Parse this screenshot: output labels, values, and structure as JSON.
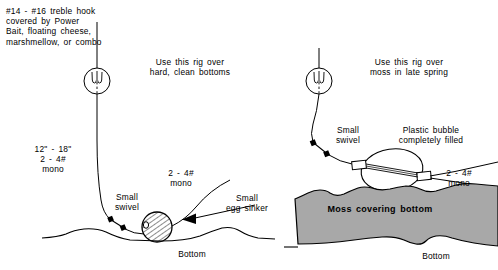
{
  "diagram": {
    "title_hidden": "",
    "colors": {
      "ink": "#000000",
      "moss_fill": "#a8a8a8",
      "background": "#ffffff"
    },
    "labels": {
      "bait_note": "#14 - #16 treble hook\ncovered by Power\nBait, floating cheese,\nmarshmellow, or combo",
      "left_usage": "Use this rig over\nhard, clean bottoms",
      "right_usage": "Use this rig over\nmoss in late spring",
      "leader_left": "12\" - 18\"\n2 - 4#\nmono",
      "mono_left": "2 - 4#\nmono",
      "mono_right": "2 - 4#\nmono",
      "swivel_left": "Small\nswivel",
      "swivel_right": "Small\nswivel",
      "egg_sinker": "Small\negg sinker",
      "plastic_bubble": "Plastic bubble\ncompletely filled",
      "moss_bottom": "Moss covering bottom",
      "bottom_left": "Bottom",
      "bottom_right": "Bottom"
    },
    "icons": {
      "bait_ball_left": "treble-hook-bait-ball-icon",
      "bait_ball_right": "treble-hook-bait-ball-icon",
      "swivel_left": "swivel-icon",
      "swivel_right": "swivel-icon",
      "egg_sinker": "egg-sinker-icon",
      "plastic_bubble": "plastic-bubble-icon",
      "pointer_arrow": "arrow-pointer-icon"
    }
  }
}
